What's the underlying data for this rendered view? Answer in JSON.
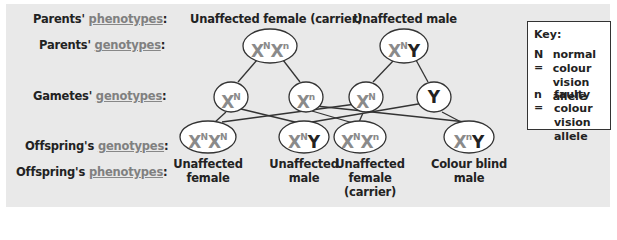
{
  "row_labels": {
    "parents_phenotypes": {
      "prefix": "Parents' ",
      "term": "phenotypes",
      "suffix": ":"
    },
    "parents_genotypes": {
      "prefix": "Parents' ",
      "term": "genotypes",
      "suffix": ":"
    },
    "gametes_genotypes": {
      "prefix": "Gametes' ",
      "term": "genotypes",
      "suffix": ":"
    },
    "offspring_genotypes": {
      "prefix": "Offspring's ",
      "term": "genotypes",
      "suffix": ":"
    },
    "offspring_phenotypes": {
      "prefix": "Offspring's ",
      "term": "phenotypes",
      "suffix": ":"
    }
  },
  "parents": [
    {
      "phenotype": "Unaffected female (carrier)",
      "genotype": {
        "a1": "X",
        "s1": "N",
        "a2": "X",
        "s2": "n"
      }
    },
    {
      "phenotype": "Unaffected male",
      "genotype": {
        "a1": "X",
        "s1": "N",
        "a2": "Y",
        "s2": ""
      }
    }
  ],
  "gametes": [
    {
      "base": "X",
      "sup": "N"
    },
    {
      "base": "X",
      "sup": "n"
    },
    {
      "base": "X",
      "sup": "N"
    },
    {
      "base": "Y",
      "sup": ""
    }
  ],
  "offspring": [
    {
      "genotype": {
        "a1": "X",
        "s1": "N",
        "a2": "X",
        "s2": "N"
      },
      "phenotype_l1": "Unaffected",
      "phenotype_l2": "female",
      "phenotype_l3": ""
    },
    {
      "genotype": {
        "a1": "X",
        "s1": "N",
        "a2": "Y",
        "s2": ""
      },
      "phenotype_l1": "Unaffected",
      "phenotype_l2": "male",
      "phenotype_l3": ""
    },
    {
      "genotype": {
        "a1": "X",
        "s1": "N",
        "a2": "X",
        "s2": "n"
      },
      "phenotype_l1": "Unaffected",
      "phenotype_l2": "female",
      "phenotype_l3": "(carrier)"
    },
    {
      "genotype": {
        "a1": "X",
        "s1": "n",
        "a2": "Y",
        "s2": ""
      },
      "phenotype_l1": "Colour blind",
      "phenotype_l2": "male",
      "phenotype_l3": ""
    }
  ],
  "key": {
    "title": "Key:",
    "entries": [
      {
        "symbol": "N =",
        "line1": "normal colour",
        "line2": "vision allele"
      },
      {
        "symbol": "n =",
        "line1": "faulty colour",
        "line2": "vision allele"
      }
    ]
  },
  "colors": {
    "x_allele": "#8a8a8a",
    "y_allele": "#222222",
    "panel_bg": "#e9e9e9",
    "line": "#333333"
  }
}
